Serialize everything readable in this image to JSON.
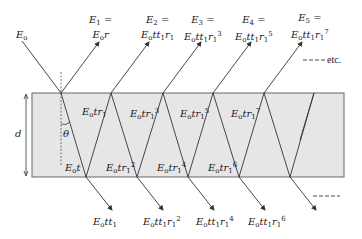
{
  "diagram": {
    "incident": {
      "label": "E_o"
    },
    "reflected_top": [
      {
        "line1": "E",
        "sub1": "1",
        "eq": " =",
        "line2_html": "E<sub>o</sub>r"
      },
      {
        "line1": "E",
        "sub1": "2",
        "eq": " =",
        "line2_html": "E<sub>o</sub>tt<sub>1</sub>r<sub>1</sub>"
      },
      {
        "line1": "E",
        "sub1": "3",
        "eq": " =",
        "line2_html": "E<sub>o</sub>tt<sub>1</sub>r<sub>1</sub><sup>3</sup>"
      },
      {
        "line1": "E",
        "sub1": "4",
        "eq": " =",
        "line2_html": "E<sub>o</sub>tt<sub>1</sub>r<sub>1</sub><sup>5</sup>"
      },
      {
        "line1": "E",
        "sub1": "5",
        "eq": " =",
        "line2_html": "E<sub>o</sub>tt<sub>1</sub>r<sub>1</sub><sup>7</sup>"
      }
    ],
    "etc_label": "etc.",
    "inside_upward": [
      "E<sub>o</sub>tr<sub>1</sub>",
      "E<sub>o</sub>tr<sub>1</sub><sup>3</sup>",
      "E<sub>o</sub>tr<sub>1</sub><sup>5</sup>",
      "E<sub>o</sub>tr<sub>1</sub><sup>7</sup>"
    ],
    "inside_downward": [
      "E<sub>o</sub>t",
      "E<sub>o</sub>tr<sub>1</sub><sup>2</sup>",
      "E<sub>o</sub>tr<sub>1</sub><sup>4</sup>",
      "E<sub>o</sub>tr<sub>1</sub><sup>6</sup>"
    ],
    "transmitted_bottom": [
      "E<sub>o</sub>tt<sub>1</sub>",
      "E<sub>o</sub>tt<sub>1</sub>r<sub>1</sub><sup>2</sup>",
      "E<sub>o</sub>tt<sub>1</sub>r<sub>1</sub><sup>4</sup>",
      "E<sub>o</sub>tt<sub>1</sub>r<sub>1</sub><sup>6</sup>"
    ],
    "thickness_label": "d",
    "angle_label": "θ",
    "colors": {
      "slab_fill": "#e6e6e6",
      "slab_stroke": "#555555",
      "line": "#333333"
    }
  }
}
